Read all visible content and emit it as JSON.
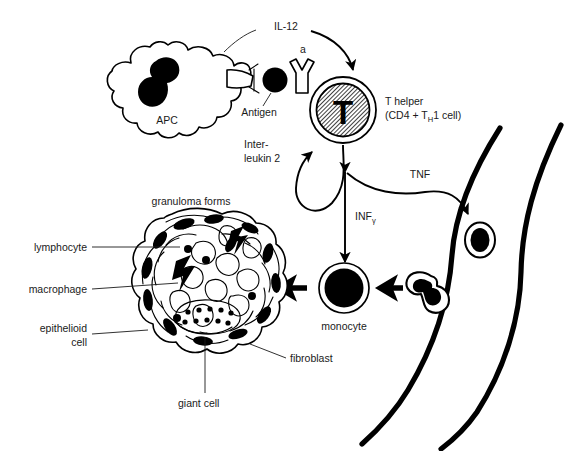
{
  "diagram": {
    "background_color": "#ffffff",
    "ink_color": "#000000",
    "nucleus_fill": "#9a9a9a"
  },
  "labels": {
    "il12": "IL-12",
    "annotation_a": "a",
    "antigen": "Antigen",
    "apc": "APC",
    "t_helper_line1": "T helper",
    "t_helper_line2_pre": "(CD4 + T",
    "t_helper_line2_sub": "H",
    "t_helper_line2_post": "1 cell)",
    "interleukin_line1": "Inter-",
    "interleukin_line2": "leukin 2",
    "tnf": "TNF",
    "inf_main": "INF",
    "inf_sub": "γ",
    "granuloma_forms": "granuloma forms",
    "lymphocyte": "lymphocyte",
    "macrophage": "macrophage",
    "epithelioid_line1": "epithelioid",
    "epithelioid_line2": "cell",
    "giant_cell": "giant cell",
    "fibroblast": "fibroblast",
    "monocyte": "monocyte",
    "t_cell_letter": "T"
  },
  "structures": {
    "apc_cell": "antigen-presenting-cell",
    "antigen_particle": "antigen-particle",
    "t_helper_cell": "t-helper-cell",
    "granuloma": "granuloma-cluster",
    "monocyte_cell": "monocyte-cell",
    "blood_vessel": "blood-vessel",
    "diapedesis_cell": "cell-crossing-vessel-wall",
    "vessel_lumen_cell": "cell-inside-vessel"
  },
  "arrows": [
    {
      "name": "il12-to-tcell",
      "from": "APC",
      "to": "T helper",
      "label": "IL-12"
    },
    {
      "name": "interleukin2-autocrine",
      "from": "T helper",
      "to": "T helper",
      "label": "Interleukin 2"
    },
    {
      "name": "infgamma-to-monocyte",
      "from": "T helper",
      "to": "monocyte",
      "label": "INFγ"
    },
    {
      "name": "tnf-to-vessel",
      "from": "T helper",
      "to": "blood vessel",
      "label": "TNF"
    },
    {
      "name": "monocyte-to-granuloma",
      "from": "monocyte",
      "to": "granuloma",
      "label": ""
    },
    {
      "name": "vessel-to-monocyte",
      "from": "blood vessel",
      "to": "monocyte",
      "label": ""
    }
  ]
}
